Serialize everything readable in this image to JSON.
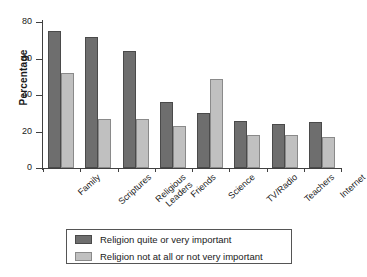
{
  "chart_data": {
    "type": "bar",
    "title": "",
    "subtitle": "",
    "xlabel": "",
    "ylabel": "Percentage",
    "ylim": [
      0,
      80
    ],
    "yticks": [
      0,
      20,
      40,
      60,
      80
    ],
    "grid": false,
    "legend_position": "bottom",
    "categories": [
      "Family",
      "Scriptures",
      "Religious Leaders",
      "Friends",
      "Science",
      "TV/Radio",
      "Teachers",
      "Internet"
    ],
    "category_lines": [
      [
        "Family"
      ],
      [
        "Scriptures"
      ],
      [
        "Religious",
        "Leaders"
      ],
      [
        "Friends"
      ],
      [
        "Science"
      ],
      [
        "TV/Radio"
      ],
      [
        "Teachers"
      ],
      [
        "Internet"
      ]
    ],
    "series": [
      {
        "name": "Religion quite or very important",
        "color": "#6e6e6e",
        "values": [
          75,
          72,
          64,
          36,
          30,
          26,
          24,
          25
        ]
      },
      {
        "name": "Religion not at all or not very important",
        "color": "#c0c0c0",
        "values": [
          52,
          27,
          27,
          23,
          49,
          18,
          18,
          17
        ]
      }
    ]
  },
  "legend": {
    "items": [
      {
        "label": "Religion quite or very important",
        "swatch": "dark"
      },
      {
        "label": "Religion not at all or not very important",
        "swatch": "light"
      }
    ]
  },
  "axis": {
    "y_title": "Percentage",
    "y_tick_labels": [
      "0",
      "20",
      "40",
      "60",
      "80"
    ]
  }
}
